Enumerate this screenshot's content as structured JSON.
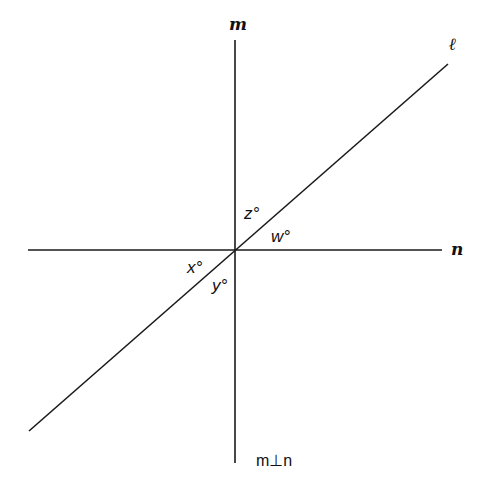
{
  "diagram": {
    "title": "",
    "lines": {
      "m": {
        "label": "m",
        "orientation": "vertical",
        "x1": 235,
        "y1": 40,
        "x2": 235,
        "y2": 463
      },
      "n": {
        "label": "n",
        "orientation": "horizontal",
        "x1": 28,
        "y1": 250,
        "x2": 442,
        "y2": 250
      },
      "l": {
        "label": "ℓ",
        "orientation": "diagonal",
        "x1": 29,
        "y1": 431,
        "x2": 448,
        "y2": 64
      }
    },
    "angles": {
      "z": {
        "label": "z°",
        "position": "between m (up) and ℓ (upper-right)"
      },
      "w": {
        "label": "w°",
        "position": "between ℓ (upper-right) and n (right)"
      },
      "x": {
        "label": "x°",
        "position": "between n (left) and ℓ (lower-left)"
      },
      "y": {
        "label": "y°",
        "position": "between ℓ (lower-left) and m (down)"
      }
    },
    "note": {
      "text": "m⊥n"
    },
    "colors": {
      "background": "#ffffff",
      "stroke": "#1a1a1a",
      "text": "#111111"
    }
  }
}
